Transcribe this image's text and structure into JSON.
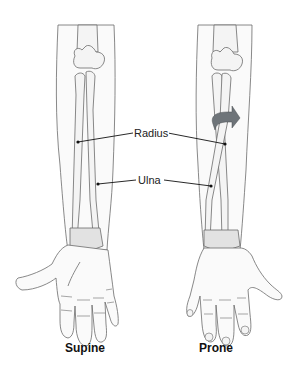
{
  "diagram": {
    "labels": {
      "radius": "Radius",
      "ulna": "Ulna"
    },
    "captions": {
      "left": "Supine",
      "right": "Prone"
    },
    "colors": {
      "outline": "#6b6b6b",
      "bone_fill": "#f4f4f4",
      "skin_fill": "#fafafa",
      "shade": "#e2e2e2",
      "arrow": "#6e7479",
      "leader": "#111111"
    },
    "icons": {
      "rotation_arrow": "curved-arrow-icon"
    }
  }
}
